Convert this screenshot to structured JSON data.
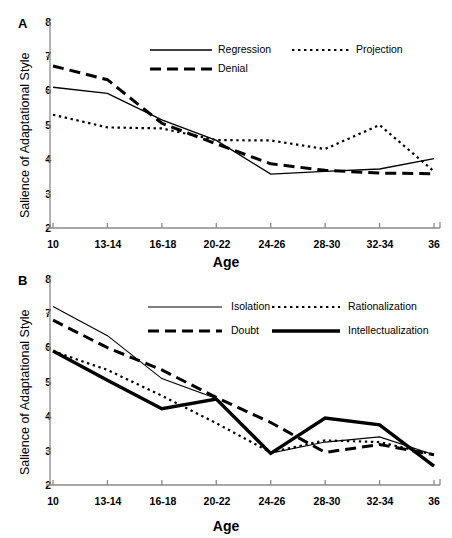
{
  "figure": {
    "panels": [
      {
        "letter": "A",
        "ylabel": "Salience of Adaptational Style",
        "xlabel": "Age"
      },
      {
        "letter": "B",
        "ylabel": "Salience of Adaptational Style",
        "xlabel": "Age"
      }
    ]
  },
  "axis": {
    "yticks": [
      "2",
      "3",
      "4",
      "5",
      "6",
      "7",
      "8"
    ],
    "xticks": [
      "10",
      "13-14",
      "16-18",
      "20-22",
      "24-26",
      "28-30",
      "32-34",
      "36"
    ]
  },
  "chart_data": [
    {
      "type": "line",
      "panel": "A",
      "title": "",
      "xlabel": "Age",
      "ylabel": "Salience of Adaptational Style",
      "categories": [
        "10",
        "13-14",
        "16-18",
        "20-22",
        "24-26",
        "28-30",
        "32-34",
        "36"
      ],
      "ylim": [
        2,
        8
      ],
      "grid": false,
      "legend_position": "top-center",
      "series": [
        {
          "name": "Regression",
          "style": "solid",
          "values": [
            6.1,
            5.92,
            5.15,
            4.55,
            3.57,
            3.65,
            3.72,
            4.02
          ]
        },
        {
          "name": "Denial",
          "style": "dashed",
          "values": [
            6.72,
            6.32,
            5.05,
            4.45,
            3.87,
            3.68,
            3.6,
            3.58
          ]
        },
        {
          "name": "Projection",
          "style": "dotted",
          "values": [
            5.3,
            4.93,
            4.9,
            4.56,
            4.55,
            4.3,
            5.0,
            3.65
          ]
        }
      ]
    },
    {
      "type": "line",
      "panel": "B",
      "title": "",
      "xlabel": "Age",
      "ylabel": "Salience of Adaptational Style",
      "categories": [
        "10",
        "13-14",
        "16-18",
        "20-22",
        "24-26",
        "28-30",
        "32-34",
        "36"
      ],
      "ylim": [
        2,
        8
      ],
      "grid": false,
      "legend_position": "top-center",
      "series": [
        {
          "name": "Isolation",
          "style": "solid-thin",
          "values": [
            7.2,
            6.35,
            5.1,
            4.52,
            2.93,
            3.25,
            3.4,
            2.88
          ]
        },
        {
          "name": "Rationalization",
          "style": "dotted",
          "values": [
            5.9,
            5.35,
            4.6,
            3.8,
            2.95,
            3.3,
            3.25,
            2.88
          ]
        },
        {
          "name": "Doubt",
          "style": "dashed",
          "values": [
            6.8,
            6.0,
            5.35,
            4.55,
            3.82,
            2.95,
            3.18,
            2.88
          ]
        },
        {
          "name": "Intellectualization",
          "style": "solid-thick",
          "values": [
            5.9,
            5.05,
            4.22,
            4.5,
            2.92,
            3.95,
            3.75,
            2.55
          ]
        }
      ]
    }
  ],
  "legends": {
    "panel_a": [
      {
        "label": "Regression",
        "style": "solid"
      },
      {
        "label": "Projection",
        "style": "dotted"
      },
      {
        "label": "Denial",
        "style": "dashed"
      }
    ],
    "panel_b": [
      {
        "label": "Isolation",
        "style": "solid-thin"
      },
      {
        "label": "Rationalization",
        "style": "dotted"
      },
      {
        "label": "Doubt",
        "style": "dashed"
      },
      {
        "label": "Intellectualization",
        "style": "solid-thick"
      }
    ]
  },
  "colors": {
    "ink": "#000000",
    "axis": "#8a8a8a",
    "background": "#ffffff"
  }
}
